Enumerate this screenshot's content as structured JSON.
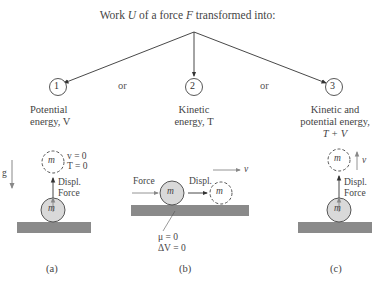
{
  "title": {
    "prefix": "Work ",
    "U": "U",
    "mid1": " of a force ",
    "F": "F",
    "suffix": " transformed into:"
  },
  "options": [
    {
      "number": "1",
      "line1": "Potential",
      "line2": "energy, V"
    },
    {
      "number": "2",
      "line1": "Kinetic",
      "line2": "energy, T"
    },
    {
      "number": "3",
      "line1": "Kinetic and",
      "line2": "potential energy,",
      "line3": "T + V"
    }
  ],
  "connectors": {
    "or_1": "or",
    "or_2": "or"
  },
  "panel_a": {
    "gravity_label": "g",
    "mass_label_top": "m",
    "mass_label_bottom": "m",
    "v_eq": "v = 0",
    "T_eq": "T = 0",
    "displ_label": "Displ.",
    "force_label": "Force",
    "caption": "(a)"
  },
  "panel_b": {
    "force_label": "Force",
    "displ_label": "Displ.",
    "mass_label_left": "m",
    "mass_label_right": "m",
    "velocity_label": "v",
    "mu_eq": "μ = 0",
    "dV_eq": "ΔV = 0",
    "caption": "(b)"
  },
  "panel_c": {
    "mass_label_top": "m",
    "mass_label_bottom": "m",
    "velocity_label": "v",
    "displ_label": "Displ.",
    "force_label": "Force",
    "caption": "(c)"
  },
  "colors": {
    "ground": "#8a8a8a",
    "mass_fill": "#d9d9d9",
    "line": "#333333",
    "gray_text": "#999999"
  }
}
